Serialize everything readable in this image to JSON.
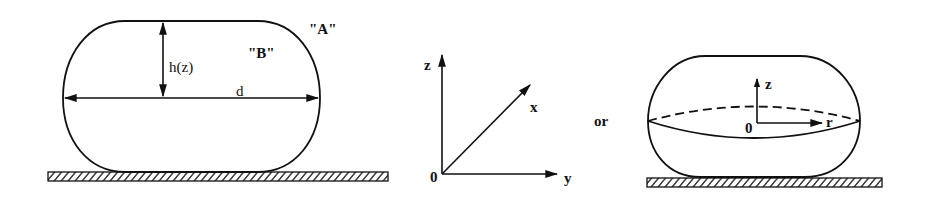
{
  "figure": {
    "left_drop": {
      "label_outside": "\"A\"",
      "label_inside": "\"B\"",
      "height_label": "h(z)",
      "diameter_label": "d"
    },
    "axes": {
      "z_label": "z",
      "x_label": "x",
      "y_label": "y",
      "origin_label": "0"
    },
    "connector": "or",
    "right_drop": {
      "z_label": "z",
      "r_label": "r",
      "origin_label": "0"
    },
    "colors": {
      "stroke": "#111111",
      "background": "#ffffff"
    }
  }
}
